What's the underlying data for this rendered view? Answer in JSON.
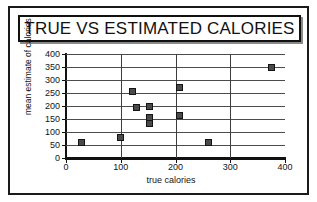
{
  "figure": {
    "title": "TRUE VS ESTIMATED CALORIES"
  },
  "chart_data": {
    "type": "scatter",
    "title": "TRUE VS ESTIMATED CALORIES",
    "xlabel": "true calories",
    "ylabel": "mean estimate of calories",
    "xlim": [
      0,
      400
    ],
    "ylim": [
      0,
      400
    ],
    "xticks": [
      0,
      100,
      200,
      300,
      400
    ],
    "yticks": [
      0,
      50,
      100,
      150,
      200,
      250,
      300,
      350,
      400
    ],
    "grid": "horizontal-and-vertical",
    "legend": "none",
    "marker": "filled-square",
    "marker_color": "#4a4a4a",
    "marker_edge_color": "#141414",
    "points": [
      {
        "x": 28,
        "y": 58
      },
      {
        "x": 100,
        "y": 77
      },
      {
        "x": 122,
        "y": 255
      },
      {
        "x": 128,
        "y": 195
      },
      {
        "x": 152,
        "y": 200
      },
      {
        "x": 152,
        "y": 155
      },
      {
        "x": 152,
        "y": 133
      },
      {
        "x": 207,
        "y": 270
      },
      {
        "x": 207,
        "y": 162
      },
      {
        "x": 260,
        "y": 58
      },
      {
        "x": 375,
        "y": 348
      }
    ]
  }
}
